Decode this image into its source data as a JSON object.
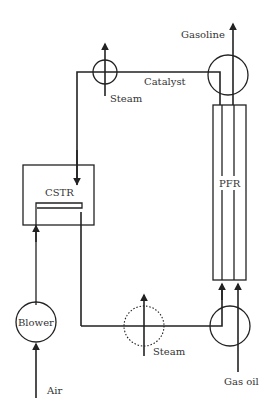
{
  "diagram": {
    "colors": {
      "line": "#222222",
      "text": "#333333",
      "background": "#ffffff"
    },
    "units": [
      {
        "id": "cstr",
        "label": "CSTR",
        "shape": "rectangle"
      },
      {
        "id": "pfr",
        "label": "PFR",
        "shape": "tube"
      },
      {
        "id": "blower",
        "label": "Blower",
        "shape": "circle"
      }
    ],
    "streams": {
      "gasoline": "Gasoline",
      "catalyst": "Catalyst",
      "steam_top": "Steam",
      "steam_bottom": "Steam",
      "air": "Air",
      "gas_oil": "Gas oil"
    },
    "heat_exchangers": [
      {
        "id": "hx-top",
        "style": "solid",
        "medium": "Steam"
      },
      {
        "id": "hx-bottom",
        "style": "dotted",
        "medium": "Steam"
      },
      {
        "id": "separator-top",
        "style": "solid"
      },
      {
        "id": "mixer-bottom",
        "style": "solid"
      }
    ]
  }
}
